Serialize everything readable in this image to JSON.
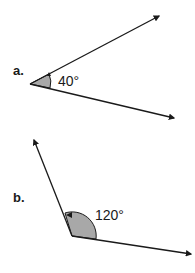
{
  "figure": {
    "line_color": "#1a1a1a",
    "fill_color": "#a8a8a8",
    "angles": [
      {
        "part_label": "a.",
        "measure_label": "40°",
        "degrees": 40,
        "arc_direction": "counterclockwise"
      },
      {
        "part_label": "b.",
        "measure_label": "120°",
        "degrees": 120,
        "arc_direction": "counterclockwise"
      }
    ]
  }
}
